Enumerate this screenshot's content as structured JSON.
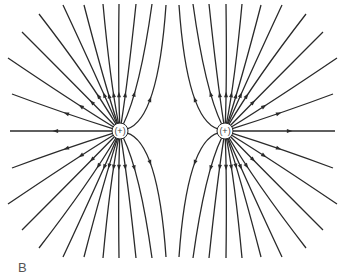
{
  "figure": {
    "panel_label": "B",
    "line_color": "#2a2a2a",
    "charges": [
      {
        "id": "left",
        "label": "(+)",
        "cx": 120,
        "cy": 131,
        "r": 7
      },
      {
        "id": "right",
        "label": "(+)",
        "cx": 225,
        "cy": 131,
        "r": 7
      }
    ],
    "field_lines_left_upper": [
      {
        "end": [
          10,
          131
        ],
        "ctrl": [
          60,
          131
        ],
        "arrow_t": 0.55
      },
      {
        "end": [
          12,
          94
        ],
        "ctrl": [
          60,
          112
        ],
        "arrow_t": 0.45
      },
      {
        "end": [
          8,
          58
        ],
        "ctrl": [
          70,
          100
        ],
        "arrow_t": 0.35
      },
      {
        "end": [
          22,
          32
        ],
        "ctrl": [
          80,
          90
        ],
        "arrow_t": 0.3
      },
      {
        "end": [
          39,
          14
        ],
        "ctrl": [
          90,
          80
        ],
        "arrow_t": 0.3
      },
      {
        "end": [
          63,
          5
        ],
        "ctrl": [
          98,
          80
        ],
        "arrow_t": 0.3
      },
      {
        "end": [
          84,
          5
        ],
        "ctrl": [
          104,
          82
        ],
        "arrow_t": 0.3
      },
      {
        "end": [
          103,
          4
        ],
        "ctrl": [
          110,
          80
        ],
        "arrow_t": 0.3
      },
      {
        "end": [
          119,
          4
        ],
        "ctrl": [
          118,
          80
        ],
        "arrow_t": 0.3
      },
      {
        "end": [
          136,
          4
        ],
        "ctrl": [
          128,
          80
        ],
        "arrow_t": 0.3
      },
      {
        "end": [
          152,
          4
        ],
        "ctrl": [
          140,
          90
        ],
        "arrow_t": 0.35
      },
      {
        "end": [
          166,
          5
        ],
        "ctrl": [
          158,
          120
        ],
        "arrow_t": 0.45
      }
    ]
  }
}
